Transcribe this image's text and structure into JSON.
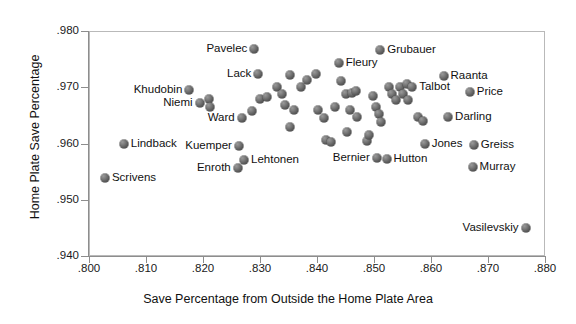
{
  "chart_data": {
    "type": "scatter",
    "title": "",
    "xlabel": "Save Percentage from Outside the Home Plate Area",
    "ylabel": "Home Plate Save Percentage",
    "xlim": [
      0.8,
      0.88
    ],
    "ylim": [
      0.94,
      0.98
    ],
    "xticks": [
      ".800",
      ".810",
      ".820",
      ".830",
      ".840",
      ".850",
      ".860",
      ".870",
      ".880"
    ],
    "yticks": [
      ".940",
      ".950",
      ".960",
      ".970",
      ".980"
    ],
    "xtick_values": [
      0.8,
      0.81,
      0.82,
      0.83,
      0.84,
      0.85,
      0.86,
      0.87,
      0.88
    ],
    "ytick_values": [
      0.94,
      0.95,
      0.96,
      0.97,
      0.98
    ],
    "grid": false,
    "legend": "none",
    "marker_color": "#666666",
    "points": [
      {
        "label": "Scrivens",
        "x": 0.8028,
        "y": 0.9538,
        "label_side": "right"
      },
      {
        "label": "Lindback",
        "x": 0.8061,
        "y": 0.96,
        "label_side": "right"
      },
      {
        "label": "Khudobin",
        "x": 0.8176,
        "y": 0.9695,
        "label_side": "left"
      },
      {
        "label": "Niemi",
        "x": 0.8194,
        "y": 0.9672,
        "label_side": "left"
      },
      {
        "label": "",
        "x": 0.8211,
        "y": 0.968,
        "label_side": "right"
      },
      {
        "label": "",
        "x": 0.8213,
        "y": 0.9665,
        "label_side": "right"
      },
      {
        "label": "Kuemper",
        "x": 0.8263,
        "y": 0.9595,
        "label_side": "left"
      },
      {
        "label": "Enroth",
        "x": 0.8261,
        "y": 0.9556,
        "label_side": "left"
      },
      {
        "label": "Lehtonen",
        "x": 0.8272,
        "y": 0.957,
        "label_side": "right"
      },
      {
        "label": "Ward",
        "x": 0.8268,
        "y": 0.9645,
        "label_side": "left"
      },
      {
        "label": "",
        "x": 0.8286,
        "y": 0.9657,
        "label_side": "right"
      },
      {
        "label": "Pavelec",
        "x": 0.829,
        "y": 0.9768,
        "label_side": "left"
      },
      {
        "label": "Lack",
        "x": 0.8297,
        "y": 0.9723,
        "label_side": "left"
      },
      {
        "label": "",
        "x": 0.83,
        "y": 0.968,
        "label_side": "right"
      },
      {
        "label": "",
        "x": 0.8313,
        "y": 0.9683,
        "label_side": "right"
      },
      {
        "label": "",
        "x": 0.833,
        "y": 0.97,
        "label_side": "right"
      },
      {
        "label": "",
        "x": 0.8338,
        "y": 0.9688,
        "label_side": "right"
      },
      {
        "label": "",
        "x": 0.8344,
        "y": 0.9668,
        "label_side": "right"
      },
      {
        "label": "",
        "x": 0.8353,
        "y": 0.9722,
        "label_side": "right"
      },
      {
        "label": "",
        "x": 0.836,
        "y": 0.966,
        "label_side": "right"
      },
      {
        "label": "",
        "x": 0.8352,
        "y": 0.963,
        "label_side": "right"
      },
      {
        "label": "",
        "x": 0.8372,
        "y": 0.97,
        "label_side": "right"
      },
      {
        "label": "",
        "x": 0.8382,
        "y": 0.9713,
        "label_side": "right"
      },
      {
        "label": "",
        "x": 0.8398,
        "y": 0.9723,
        "label_side": "right"
      },
      {
        "label": "",
        "x": 0.8402,
        "y": 0.966,
        "label_side": "right"
      },
      {
        "label": "",
        "x": 0.8413,
        "y": 0.9645,
        "label_side": "right"
      },
      {
        "label": "",
        "x": 0.8416,
        "y": 0.9607,
        "label_side": "right"
      },
      {
        "label": "",
        "x": 0.8424,
        "y": 0.9603,
        "label_side": "right"
      },
      {
        "label": "",
        "x": 0.8431,
        "y": 0.9665,
        "label_side": "right"
      },
      {
        "label": "Fleury",
        "x": 0.8438,
        "y": 0.9743,
        "label_side": "right"
      },
      {
        "label": "",
        "x": 0.8442,
        "y": 0.9712,
        "label_side": "right"
      },
      {
        "label": "",
        "x": 0.845,
        "y": 0.9688,
        "label_side": "right"
      },
      {
        "label": "",
        "x": 0.8461,
        "y": 0.969,
        "label_side": "right"
      },
      {
        "label": "",
        "x": 0.8468,
        "y": 0.9693,
        "label_side": "right"
      },
      {
        "label": "",
        "x": 0.8458,
        "y": 0.966,
        "label_side": "right"
      },
      {
        "label": "",
        "x": 0.847,
        "y": 0.9648,
        "label_side": "right"
      },
      {
        "label": "",
        "x": 0.8452,
        "y": 0.962,
        "label_side": "right"
      },
      {
        "label": "Bernier",
        "x": 0.8505,
        "y": 0.9575,
        "label_side": "left"
      },
      {
        "label": "Hutton",
        "x": 0.8522,
        "y": 0.9572,
        "label_side": "right"
      },
      {
        "label": "",
        "x": 0.8488,
        "y": 0.9605,
        "label_side": "right"
      },
      {
        "label": "",
        "x": 0.8492,
        "y": 0.9615,
        "label_side": "right"
      },
      {
        "label": "",
        "x": 0.8499,
        "y": 0.9684,
        "label_side": "right"
      },
      {
        "label": "",
        "x": 0.8503,
        "y": 0.9665,
        "label_side": "right"
      },
      {
        "label": "",
        "x": 0.8508,
        "y": 0.9652,
        "label_side": "right"
      },
      {
        "label": "",
        "x": 0.8513,
        "y": 0.9638,
        "label_side": "right"
      },
      {
        "label": "Grubauer",
        "x": 0.8511,
        "y": 0.9767,
        "label_side": "right"
      },
      {
        "label": "",
        "x": 0.8526,
        "y": 0.97,
        "label_side": "right"
      },
      {
        "label": "",
        "x": 0.8531,
        "y": 0.9688,
        "label_side": "right"
      },
      {
        "label": "",
        "x": 0.8538,
        "y": 0.9678,
        "label_side": "right"
      },
      {
        "label": "",
        "x": 0.8545,
        "y": 0.97,
        "label_side": "right"
      },
      {
        "label": "",
        "x": 0.8551,
        "y": 0.9688,
        "label_side": "right"
      },
      {
        "label": "",
        "x": 0.8558,
        "y": 0.9705,
        "label_side": "right"
      },
      {
        "label": "",
        "x": 0.856,
        "y": 0.9678,
        "label_side": "right"
      },
      {
        "label": "Talbot",
        "x": 0.8567,
        "y": 0.97,
        "label_side": "right"
      },
      {
        "label": "Jones",
        "x": 0.8589,
        "y": 0.96,
        "label_side": "right"
      },
      {
        "label": "",
        "x": 0.8577,
        "y": 0.9648,
        "label_side": "right"
      },
      {
        "label": "",
        "x": 0.8586,
        "y": 0.964,
        "label_side": "right"
      },
      {
        "label": "Raanta",
        "x": 0.8622,
        "y": 0.972,
        "label_side": "right"
      },
      {
        "label": "Darling",
        "x": 0.863,
        "y": 0.9648,
        "label_side": "right"
      },
      {
        "label": "Price",
        "x": 0.8668,
        "y": 0.9692,
        "label_side": "right"
      },
      {
        "label": "Greiss",
        "x": 0.8675,
        "y": 0.9597,
        "label_side": "right"
      },
      {
        "label": "Murray",
        "x": 0.8673,
        "y": 0.9558,
        "label_side": "right"
      },
      {
        "label": "Vasilevskiy",
        "x": 0.8766,
        "y": 0.945,
        "label_side": "left"
      }
    ]
  }
}
